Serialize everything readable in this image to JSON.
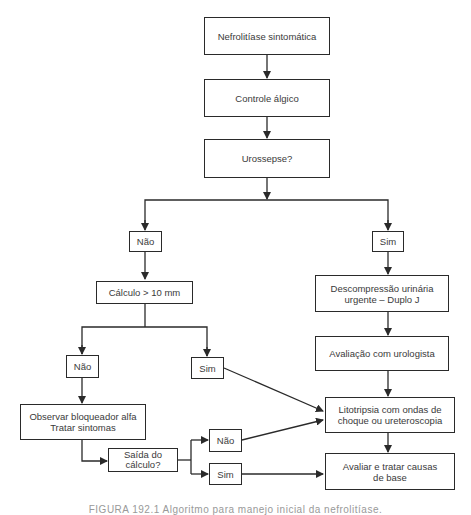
{
  "flowchart": {
    "nodes": {
      "start": "Nefrolitíase sintomática",
      "pain": "Controle álgico",
      "sepsis": "Urossepse?",
      "sepsis_no": "Não",
      "sepsis_yes": "Sim",
      "size": "Cálculo > 10 mm",
      "decompress_l1": "Descompressão urinária",
      "decompress_l2": "urgente – Duplo J",
      "urologist": "Avaliação com urologista",
      "size_no": "Não",
      "size_yes": "Sim",
      "observe_l1": "Observar bloqueador alfa",
      "observe_l2": "Tratar sintomas",
      "litho_l1": "Litotripsia com ondas de",
      "litho_l2": "choque ou ureteroscopia",
      "passed_l1": "Saída do",
      "passed_l2": "cálculo?",
      "passed_no": "Não",
      "passed_yes": "Sim",
      "causes_l1": "Avaliar e tratar causas",
      "causes_l2": "de base"
    },
    "line_color": "#2a2a2a",
    "caption": "FIGURA 192.1 Algoritmo para manejo inicial da nefrolitíase."
  }
}
